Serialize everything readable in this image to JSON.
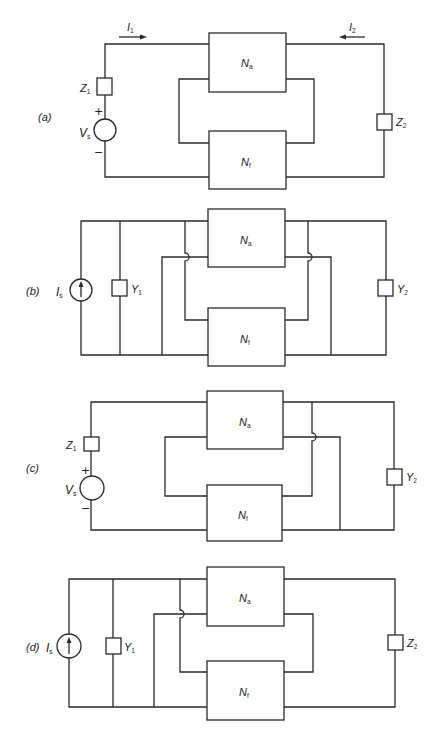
{
  "figure": {
    "panels": [
      {
        "id": "a",
        "label": "(a)",
        "source": {
          "type": "voltage",
          "symbol": "V",
          "subscript": "s",
          "plus": "+",
          "minus": "−"
        },
        "port1_element": {
          "symbol": "Z",
          "subscript": "1",
          "connection": "series"
        },
        "port2_element": {
          "symbol": "Z",
          "subscript": "2",
          "connection": "series"
        },
        "currents": [
          {
            "symbol": "I",
            "subscript": "1",
            "direction": "right"
          },
          {
            "symbol": "I",
            "subscript": "2",
            "direction": "left"
          }
        ],
        "blocks": [
          {
            "symbol": "N",
            "subscript": "a"
          },
          {
            "symbol": "N",
            "subscript": "f"
          }
        ],
        "input_connection": "series-series",
        "output_connection": "series"
      },
      {
        "id": "b",
        "label": "(b)",
        "source": {
          "type": "current",
          "symbol": "I",
          "subscript": "s"
        },
        "port1_element": {
          "symbol": "Y",
          "subscript": "1",
          "connection": "shunt"
        },
        "port2_element": {
          "symbol": "Y",
          "subscript": "2",
          "connection": "shunt"
        },
        "blocks": [
          {
            "symbol": "N",
            "subscript": "a"
          },
          {
            "symbol": "N",
            "subscript": "f"
          }
        ],
        "input_connection": "shunt",
        "output_connection": "shunt"
      },
      {
        "id": "c",
        "label": "(c)",
        "source": {
          "type": "voltage",
          "symbol": "V",
          "subscript": "s",
          "plus": "+",
          "minus": "−"
        },
        "port1_element": {
          "symbol": "Z",
          "subscript": "1",
          "connection": "series"
        },
        "port2_element": {
          "symbol": "Y",
          "subscript": "2",
          "connection": "shunt"
        },
        "blocks": [
          {
            "symbol": "N",
            "subscript": "a"
          },
          {
            "symbol": "N",
            "subscript": "f"
          }
        ],
        "input_connection": "series",
        "output_connection": "shunt"
      },
      {
        "id": "d",
        "label": "(d)",
        "source": {
          "type": "current",
          "symbol": "I",
          "subscript": "s"
        },
        "port1_element": {
          "symbol": "Y",
          "subscript": "1",
          "connection": "shunt"
        },
        "port2_element": {
          "symbol": "Z",
          "subscript": "2",
          "connection": "series"
        },
        "blocks": [
          {
            "symbol": "N",
            "subscript": "a"
          },
          {
            "symbol": "N",
            "subscript": "f"
          }
        ],
        "input_connection": "shunt",
        "output_connection": "series"
      }
    ]
  },
  "colors": {
    "ink": "#2a2a2a",
    "background": "#ffffff"
  }
}
